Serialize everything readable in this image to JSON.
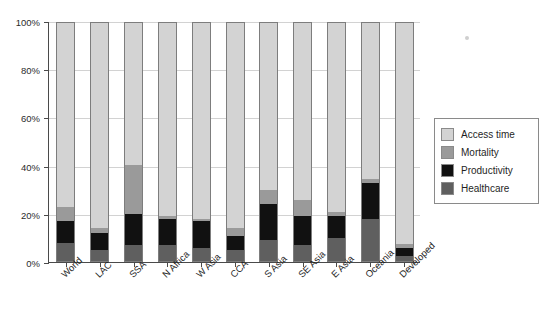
{
  "chart_data": {
    "type": "bar",
    "stacked": true,
    "title": "",
    "xlabel": "",
    "ylabel": "",
    "ylim": [
      0,
      100
    ],
    "ytick_labels": [
      "0%",
      "20%",
      "40%",
      "60%",
      "80%",
      "100%"
    ],
    "ytick_values": [
      0,
      20,
      40,
      60,
      80,
      100
    ],
    "grid": true,
    "legend_position": "right",
    "categories": [
      "World",
      "LAC",
      "SSA",
      "N Africa",
      "W Asia",
      "CCA",
      "S Asia",
      "SE Asia",
      "E Asia",
      "Oceania",
      "Developed"
    ],
    "series": [
      {
        "name": "Healthcare",
        "color": "#5f5f5f",
        "values": [
          8,
          5,
          7,
          7,
          6,
          5,
          9,
          7,
          10,
          18,
          2.5
        ]
      },
      {
        "name": "Productivity",
        "color": "#111111",
        "values": [
          9,
          7,
          13,
          11,
          11,
          6,
          15,
          12,
          9,
          15,
          3.5
        ]
      },
      {
        "name": "Mortality",
        "color": "#9a9a9a",
        "values": [
          6,
          2,
          20.5,
          1,
          1,
          3,
          6,
          7,
          2,
          1.5,
          1.5
        ]
      },
      {
        "name": "Access time",
        "color": "#d3d3d3",
        "values": [
          77,
          86,
          59.5,
          81,
          82,
          86,
          70,
          74,
          79,
          65.5,
          92.5
        ]
      }
    ],
    "legend_entries": [
      {
        "label": "Access time",
        "color": "#d3d3d3"
      },
      {
        "label": "Mortality",
        "color": "#9a9a9a"
      },
      {
        "label": "Productivity",
        "color": "#111111"
      },
      {
        "label": "Healthcare",
        "color": "#5f5f5f"
      }
    ]
  }
}
